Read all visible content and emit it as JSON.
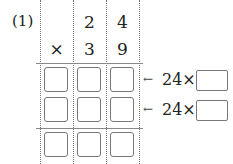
{
  "problem": {
    "number_label": "(1)",
    "multiplicand_digits": [
      "2",
      "4"
    ],
    "operator": "×",
    "multiplier_digits": [
      "3",
      "9"
    ],
    "partial_rows": [
      {
        "arrow": "←",
        "hint": "24×",
        "answer": ""
      },
      {
        "arrow": "←",
        "hint": "24×",
        "answer": ""
      }
    ],
    "answer_grid": [
      [
        "",
        "",
        ""
      ],
      [
        "",
        "",
        ""
      ],
      [
        "",
        "",
        ""
      ]
    ]
  }
}
